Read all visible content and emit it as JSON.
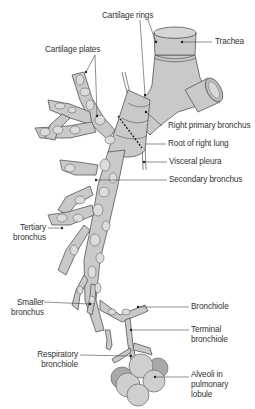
{
  "diagram": {
    "labels": {
      "cartilage_rings": "Cartilage rings",
      "trachea": "Trachea",
      "cartilage_plates": "Cartilage plates",
      "right_primary_bronchus": "Right primary bronchus",
      "root_of_right_lung": "Root of right lung",
      "visceral_pleura": "Visceral pleura",
      "secondary_bronchus": "Secondary bronchus",
      "tertiary_bronchus_l1": "Tertiary",
      "tertiary_bronchus_l2": "bronchus",
      "smaller_bronchus_l1": "Smaller",
      "smaller_bronchus_l2": "bronchus",
      "bronchiole": "Bronchiole",
      "terminal_bronchiole_l1": "Terminal",
      "terminal_bronchiole_l2": "bronchiole",
      "respiratory_bronchiole_l1": "Respiratory",
      "respiratory_bronchiole_l2": "bronchiole",
      "alveoli_l1": "Alveoli in",
      "alveoli_l2": "pulmonary",
      "alveoli_l3": "lobule"
    },
    "colors": {
      "tissue": "#c9c9c9",
      "plate": "#dcdcdc",
      "outline": "#555555",
      "alveoli_light": "#cfcfcf",
      "alveoli_dark": "#a9a9a9"
    }
  }
}
